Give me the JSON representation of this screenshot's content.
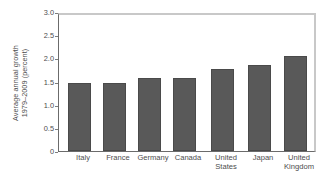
{
  "chart_data": {
    "type": "bar",
    "title": "",
    "subtitle": "",
    "xlabel": "",
    "ylabel": "Average annual growth 1979–2009 (percent)",
    "ylabel_lines": [
      "Average annual growth",
      "1979–2009 (percent)"
    ],
    "categories": [
      "Italy",
      "France",
      "Germany",
      "Canada",
      "United States",
      "Japan",
      "United Kingdom"
    ],
    "category_lines": [
      [
        "Italy"
      ],
      [
        "France"
      ],
      [
        "Germany"
      ],
      [
        "Canada"
      ],
      [
        "United",
        "States"
      ],
      [
        "Japan"
      ],
      [
        "United",
        "Kingdom"
      ]
    ],
    "values": [
      1.5,
      1.5,
      1.6,
      1.6,
      1.8,
      1.9,
      2.1
    ],
    "ylim": [
      0,
      3.0
    ],
    "yticks": [
      0,
      0.5,
      1.0,
      1.5,
      2.0,
      2.5,
      3.0
    ],
    "ytick_labels": [
      "0",
      "0.5",
      "1.0",
      "1.5",
      "2.0",
      "2.5",
      "3.0"
    ],
    "grid": false,
    "legend": false,
    "legend_position": "none",
    "bar_color": "#595959",
    "bar_edge_color": "#4a4a4a",
    "axis_color": "#6b6b6b",
    "frame_color": "#c8c8c8",
    "background_color": "#ffffff",
    "text_color": "#4d4d4d"
  },
  "caption": {
    "text": "",
    "visible": false
  }
}
